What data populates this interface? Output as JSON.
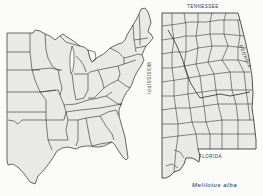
{
  "figure": {
    "caption": "Melilotus alba",
    "panels": [
      {
        "id": "eastern-us",
        "description": "Outline map of eastern United States with state boundaries"
      },
      {
        "id": "alabama-counties",
        "description": "Alabama county outline map"
      }
    ],
    "labels": {
      "north": "TENNESSEE",
      "south": "FLORIDA",
      "west": "MISSISSIPPI",
      "east": "GEORGIA"
    },
    "colors": {
      "land_fill": "#e9e9e7",
      "boundary": "#2b2b2b",
      "background": "#fbfbf9"
    }
  }
}
